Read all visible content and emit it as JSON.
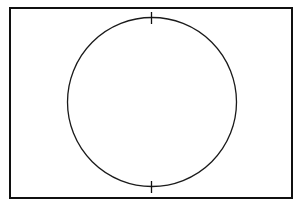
{
  "figure": {
    "canvas": {
      "width": 301,
      "height": 206,
      "background_color": "#ffffff"
    },
    "shapes": {
      "frame": {
        "label": "rectangle-frame",
        "x": 10,
        "y": 8,
        "width": 282,
        "height": 190,
        "stroke_color": "#101010",
        "stroke_width": 2,
        "fill": "none"
      },
      "circle": {
        "label": "inscribed-circle",
        "center_x": 152,
        "center_y": 102,
        "radius": 84.5,
        "stroke_color": "#1a1a1a",
        "stroke_width": 1.3,
        "fill": "none"
      },
      "ticks": [
        {
          "label": "top-tick-mark",
          "x": 151.5,
          "y1": 12,
          "y2": 24,
          "stroke_color": "#101010",
          "stroke_width": 1.3
        },
        {
          "label": "bottom-tick-mark",
          "x": 151.5,
          "y1": 181,
          "y2": 193,
          "stroke_color": "#101010",
          "stroke_width": 1.3
        }
      ]
    }
  }
}
